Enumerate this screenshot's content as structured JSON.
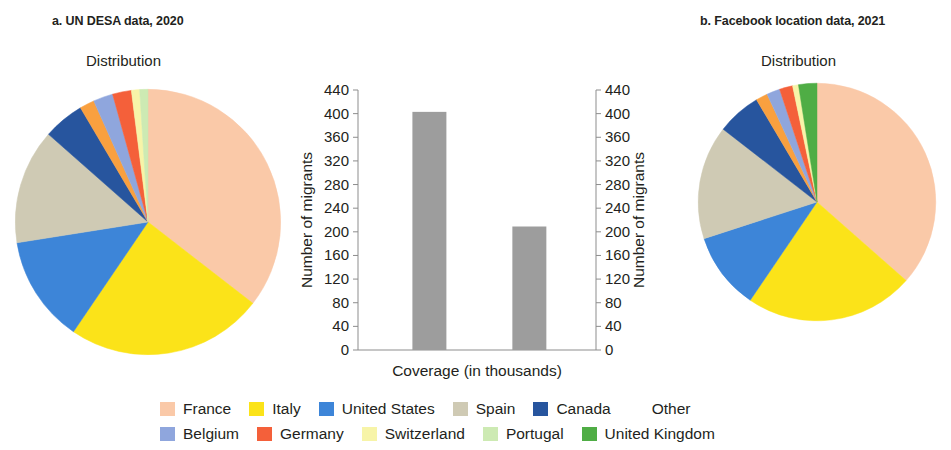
{
  "panels": {
    "a": {
      "title": "a. UN DESA data, 2020",
      "subtitle": "Distribution"
    },
    "b": {
      "title": "b. Facebook location data, 2021",
      "subtitle": "Distribution"
    }
  },
  "legend": {
    "rows": [
      [
        {
          "label": "France",
          "color": "#fac9a8"
        },
        {
          "label": "Italy",
          "color": "#fbe319"
        },
        {
          "label": "United States",
          "color": "#3d85d8"
        },
        {
          "label": "Spain",
          "color": "#cfcab4"
        },
        {
          "label": "Canada",
          "color": "#27559e"
        },
        {
          "label": "Other",
          "color": "#f9a košt"
        }
      ],
      [
        {
          "label": "Belgium",
          "color": "#8fa6dd"
        },
        {
          "label": "Germany",
          "color": "#f4603a"
        },
        {
          "label": "Switzerland",
          "color": "#f7f4a8"
        },
        {
          "label": "Portugal",
          "color": "#cdeab3"
        },
        {
          "label": "United Kingdom",
          "color": "#4fad45"
        }
      ]
    ]
  },
  "chart_data": [
    {
      "type": "pie",
      "id": "un-desa-2020",
      "title": "a. UN DESA data, 2020",
      "subtitle": "Distribution",
      "start_angle_deg": 0,
      "direction": "clockwise",
      "labels": [
        "France",
        "Italy",
        "United States",
        "Spain",
        "Canada",
        "Other",
        "Belgium",
        "Germany",
        "Switzerland",
        "Portugal"
      ],
      "values": [
        35.5,
        24.0,
        13.0,
        14.0,
        5.0,
        1.8,
        2.4,
        2.3,
        1.0,
        1.0
      ],
      "colors": [
        "#fac9a8",
        "#fbe319",
        "#3d85d8",
        "#cfcab4",
        "#27559e",
        "#f9a03f",
        "#8fa6dd",
        "#f4603a",
        "#f7f4a8",
        "#cdeab3"
      ],
      "units": "percent"
    },
    {
      "type": "pie",
      "id": "facebook-2021",
      "title": "b. Facebook location data, 2021",
      "subtitle": "Distribution",
      "start_angle_deg": 0,
      "direction": "clockwise",
      "labels": [
        "France",
        "Italy",
        "United States",
        "Spain",
        "Canada",
        "Other",
        "Belgium",
        "Germany",
        "Switzerland",
        "United Kingdom"
      ],
      "values": [
        36.5,
        23.0,
        10.5,
        15.5,
        6.0,
        1.6,
        1.8,
        1.8,
        0.8,
        2.5
      ],
      "colors": [
        "#fac9a8",
        "#fbe319",
        "#3d85d8",
        "#cfcab4",
        "#27559e",
        "#f9a03f",
        "#8fa6dd",
        "#f4603a",
        "#f7f4a8",
        "#4fad45"
      ],
      "units": "percent"
    },
    {
      "type": "bar",
      "id": "coverage-bars",
      "xlabel": "Coverage (in thousands)",
      "ylabel": "Number of migrants",
      "ylabel_right": "Number of migrants",
      "categories": [
        "",
        ""
      ],
      "values": [
        403,
        209
      ],
      "ylim": [
        0,
        440
      ],
      "yticks": [
        0,
        40,
        80,
        120,
        160,
        200,
        240,
        280,
        320,
        360,
        400,
        440
      ],
      "bar_color": "#9d9d9d",
      "grid": false,
      "legend": "none"
    }
  ]
}
